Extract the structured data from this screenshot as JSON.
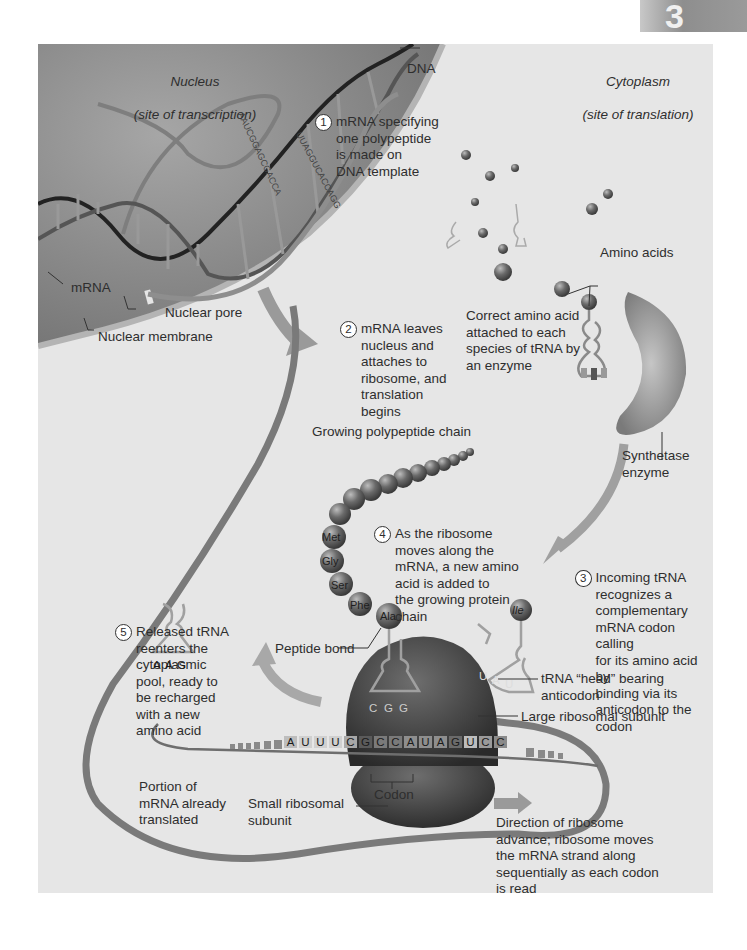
{
  "chapter_tab": {
    "number": "3"
  },
  "regions": {
    "nucleus": {
      "title": "Nucleus",
      "subtitle": "(site of transcription)"
    },
    "cytoplasm": {
      "title": "Cytoplasm",
      "subtitle": "(site of translation)"
    }
  },
  "labels": {
    "dna": "DNA",
    "mrna": "mRNA",
    "nuclear_pore": "Nuclear pore",
    "nuclear_membrane": "Nuclear membrane",
    "amino_acids": "Amino acids",
    "correct_amino_acid": "Correct amino acid\nattached to each\nspecies of tRNA by\nan enzyme",
    "synthetase_enzyme": "Synthetase\nenzyme",
    "growing_chain": "Growing polypeptide chain",
    "peptide_bond": "Peptide bond",
    "trna_head": "tRNA “head” bearing\nanticodon",
    "large_subunit": "Large ribosomal subunit",
    "small_subunit": "Small ribosomal\nsubunit",
    "codon": "Codon",
    "mrna_translated": "Portion of\nmRNA already\ntranslated",
    "direction": "Direction of ribosome\nadvance; ribosome moves\nthe mRNA strand along\nsequentially as each codon\nis read"
  },
  "steps": [
    {
      "num": "1",
      "text": "mRNA specifying\none polypeptide\nis made on\nDNA template"
    },
    {
      "num": "2",
      "text": "mRNA leaves\nnucleus and\nattaches to\nribosome, and\ntranslation\nbegins"
    },
    {
      "num": "3",
      "text": "Incoming tRNA\nrecognizes a\ncomplementary\nmRNA codon calling\nfor its amino acid by\nbinding via its\nanticodon to the\ncodon"
    },
    {
      "num": "4",
      "text": "As the ribosome\nmoves along the\nmRNA, a new amino\nacid is added to\nthe growing protein\nchain"
    },
    {
      "num": "5",
      "text": "Released tRNA\nreenters the\ncytoplasmic\npool, ready to\nbe recharged\nwith a new\namino acid"
    }
  ],
  "amino_acid_chain": [
    "Met",
    "Gly",
    "Ser",
    "Phe",
    "Ala"
  ],
  "incoming_amino_acid": "Ile",
  "released_trna_anticodon": [
    "A",
    "A",
    "G"
  ],
  "bound_trna_anticodon": [
    "C",
    "G",
    "G"
  ],
  "incoming_trna_anticodon": [
    "U",
    "A",
    "U"
  ],
  "mrna_sequence": [
    "A",
    "U",
    "U",
    "U",
    "C",
    "G",
    "C",
    "C",
    "A",
    "U",
    "A",
    "G",
    "U",
    "C",
    "C"
  ],
  "colors": {
    "background": "#e6e6e6",
    "nucleus": "#8a8a8a",
    "ribosome": "#3c3c3c",
    "text": "#2e2e2e"
  }
}
